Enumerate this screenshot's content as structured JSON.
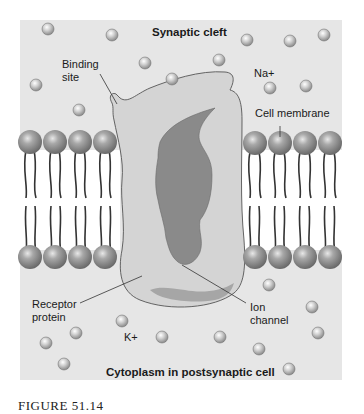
{
  "figure": {
    "caption": "FIGURE 51.14",
    "background_color": "#e6e6e6",
    "labels": {
      "synaptic_cleft": "Synaptic cleft",
      "binding_site": [
        "Binding",
        "site"
      ],
      "sodium_ion": "Na+",
      "cell_membrane": "Cell membrane",
      "receptor_protein": [
        "Receptor",
        "protein"
      ],
      "ion_channel": [
        "Ion",
        "channel"
      ],
      "potassium_ion": "K+",
      "cytoplasm": "Cytoplasm in postsynaptic cell"
    },
    "colors": {
      "panel": "#e6e6e6",
      "membrane_interior": "#ffffff",
      "receptor_protein": "#d3d3d3",
      "ion_channel": "#8a8a8a",
      "phospholipid_head": "#8c8c8c",
      "ion": "#bdbdbd"
    }
  }
}
